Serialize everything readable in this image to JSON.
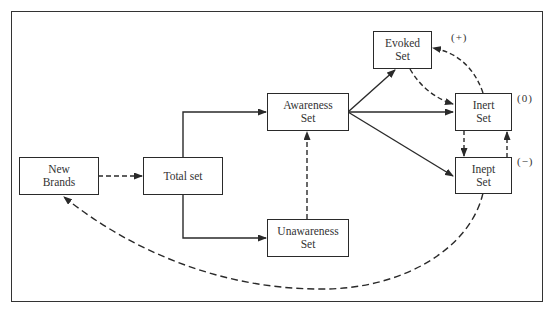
{
  "diagram": {
    "nodes": {
      "new_brands": {
        "line1": "New",
        "line2": "Brands"
      },
      "total_set": {
        "line1": "Total set"
      },
      "awareness_set": {
        "line1": "Awareness",
        "line2": "Set"
      },
      "unawareness_set": {
        "line1": "Unawareness",
        "line2": "Set"
      },
      "evoked_set": {
        "line1": "Evoked",
        "line2": "Set"
      },
      "inert_set": {
        "line1": "Inert",
        "line2": "Set"
      },
      "inept_set": {
        "line1": "Inept",
        "line2": "Set"
      }
    },
    "signs": {
      "evoked": "(+)",
      "inert": "(0)",
      "inept": "(−)"
    },
    "edges": [
      {
        "from": "New Brands",
        "to": "Total set",
        "style": "dashed"
      },
      {
        "from": "Total set",
        "to": "Awareness Set",
        "style": "solid"
      },
      {
        "from": "Total set",
        "to": "Unawareness Set",
        "style": "solid"
      },
      {
        "from": "Unawareness Set",
        "to": "Awareness Set",
        "style": "dashed"
      },
      {
        "from": "Awareness Set",
        "to": "Evoked Set",
        "style": "solid"
      },
      {
        "from": "Awareness Set",
        "to": "Inert Set",
        "style": "solid"
      },
      {
        "from": "Awareness Set",
        "to": "Inept Set",
        "style": "solid"
      },
      {
        "from": "Evoked Set",
        "to": "Inert Set",
        "style": "dashed"
      },
      {
        "from": "Inert Set",
        "to": "Evoked Set",
        "style": "dashed"
      },
      {
        "from": "Inert Set",
        "to": "Inept Set",
        "style": "dashed"
      },
      {
        "from": "Inept Set",
        "to": "Inert Set",
        "style": "dashed"
      },
      {
        "from": "Inept Set",
        "to": "New Brands",
        "style": "dashed"
      }
    ],
    "colors": {
      "line": "#2a2a2a",
      "text": "#333333",
      "background": "#ffffff"
    }
  }
}
